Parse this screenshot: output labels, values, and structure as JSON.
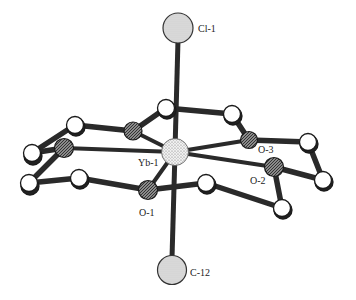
{
  "figure": {
    "type": "ball-and-stick molecular structure",
    "central_atom": "Yb-1",
    "labels": {
      "cl1": "Cl-1",
      "yb1": "Yb-1",
      "o1": "O-1",
      "o2": "O-2",
      "o3": "O-3",
      "c12": "C-12"
    }
  },
  "colors": {
    "bond": "#2a2a2a",
    "carbon_fill": "#ffffff",
    "oxygen_fill": "#6a6a6a",
    "metal_fill": "#e6e6e6",
    "axial_fill": "#d4d4d4",
    "label": "#222222"
  }
}
